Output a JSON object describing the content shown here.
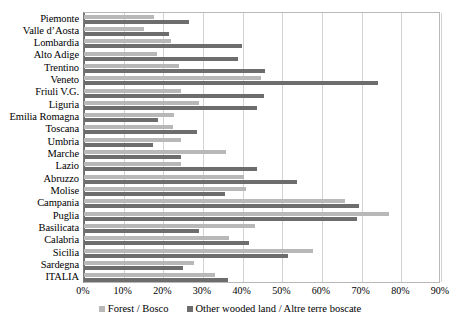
{
  "chart_data": {
    "type": "bar",
    "orientation": "horizontal",
    "title": "",
    "subtitle": "",
    "xlabel": "",
    "ylabel": "",
    "xlim": [
      0,
      90
    ],
    "xticks": [
      0,
      10,
      20,
      30,
      40,
      50,
      60,
      70,
      80,
      90
    ],
    "xtick_labels": [
      "0%",
      "10%",
      "20%",
      "30%",
      "40%",
      "50%",
      "60%",
      "70%",
      "80%",
      "90%"
    ],
    "grid": true,
    "grid_axis": "x",
    "legend_position": "bottom",
    "categories": [
      "Piemonte",
      "Valle d’Aosta",
      "Lombardia",
      "Alto Adige",
      "Trentino",
      "Veneto",
      "Friuli V.G.",
      "Liguria",
      "Emilia Romagna",
      "Toscana",
      "Umbria",
      "Marche",
      "Lazio",
      "Abruzzo",
      "Molise",
      "Campania",
      "Puglia",
      "Basilicata",
      "Calabria",
      "Sicilia",
      "Sardegna",
      "ITALIA"
    ],
    "series": [
      {
        "name": "Forest / Bosco",
        "color": "#b8b8b8",
        "values": [
          17.6,
          15.1,
          21.9,
          18.4,
          24.0,
          44.6,
          24.4,
          29.0,
          22.6,
          22.4,
          24.4,
          35.8,
          24.4,
          40.3,
          40.8,
          65.8,
          76.8,
          43.1,
          36.6,
          57.7,
          27.7,
          33.0
        ]
      },
      {
        "name": "Other wooded land / Altre terre boscate",
        "color": "#6d6d6d",
        "values": [
          26.4,
          21.4,
          39.8,
          38.8,
          45.6,
          74.0,
          45.3,
          43.6,
          18.6,
          28.5,
          17.4,
          24.4,
          43.6,
          53.7,
          35.5,
          69.3,
          68.8,
          29.0,
          41.6,
          51.4,
          24.9,
          36.3
        ]
      }
    ],
    "legend": [
      {
        "label": "Forest / Bosco",
        "swatch": "forest"
      },
      {
        "label": "Other wooded land / Altre terre boscate",
        "swatch": "other"
      }
    ]
  }
}
